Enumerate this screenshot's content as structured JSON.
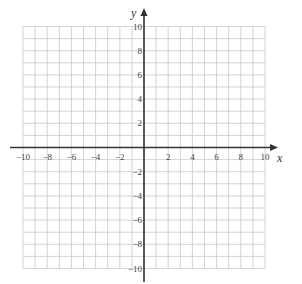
{
  "diagram": {
    "type": "coordinate-plane",
    "x_axis": {
      "label": "x",
      "min": -10,
      "max": 10,
      "step": 1,
      "tick_labels": [
        "-10",
        "-8",
        "-6",
        "-4",
        "-2",
        "2",
        "4",
        "6",
        "8",
        "10"
      ]
    },
    "y_axis": {
      "label": "y",
      "min": -10,
      "max": 10,
      "step": 1,
      "tick_labels": [
        "10",
        "8",
        "6",
        "4",
        "2",
        "-2",
        "-4",
        "-6",
        "-8",
        "-10"
      ]
    },
    "colors": {
      "grid": "#c8c8c8",
      "axis": "#333333",
      "label": "#444444"
    }
  }
}
